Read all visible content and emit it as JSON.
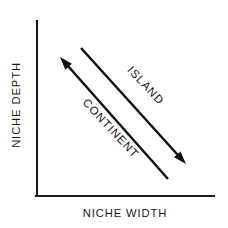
{
  "figure": {
    "title": "",
    "background_color": "#ffffff",
    "ink_color": "#111111"
  },
  "axes": {
    "x_label": "NICHE WIDTH",
    "y_label": "NICHE DEPTH",
    "x_axis_name": "x-axis-line",
    "y_axis_name": "y-axis-line",
    "origin": {
      "x": 37,
      "y": 196
    },
    "x_end": {
      "x": 214,
      "y": 196
    },
    "y_end": {
      "x": 37,
      "y": 21
    }
  },
  "annotations": [
    {
      "label": "ISLAND",
      "direction": "down-right",
      "arrow_start": {
        "x": 81,
        "y": 48
      },
      "arrow_end": {
        "x": 186,
        "y": 164
      },
      "label_angle_deg": 47,
      "label_anchor": {
        "x": 143,
        "y": 88
      }
    },
    {
      "label": "CONTINENT",
      "direction": "up-left",
      "arrow_start": {
        "x": 168,
        "y": 179
      },
      "arrow_end": {
        "x": 60,
        "y": 57
      },
      "label_angle_deg": 47,
      "label_anchor": {
        "x": 108,
        "y": 131
      }
    }
  ],
  "chart_data": {
    "type": "line",
    "title": "",
    "xlabel": "NICHE WIDTH",
    "ylabel": "NICHE DEPTH",
    "xlim": [
      0,
      1
    ],
    "ylim": [
      0,
      1
    ],
    "grid": false,
    "legend": "none",
    "axis_ticks": {
      "x": [],
      "y": []
    },
    "series": [
      {
        "name": "ISLAND",
        "kind": "arrow",
        "points": [
          [
            0.25,
            0.85
          ],
          [
            0.84,
            0.18
          ]
        ],
        "arrow_at": "end",
        "slope": "negative"
      },
      {
        "name": "CONTINENT",
        "kind": "arrow",
        "points": [
          [
            0.74,
            0.1
          ],
          [
            0.13,
            0.79
          ]
        ],
        "arrow_at": "end",
        "slope": "negative"
      }
    ],
    "annotations": [
      "ISLAND",
      "CONTINENT"
    ]
  }
}
